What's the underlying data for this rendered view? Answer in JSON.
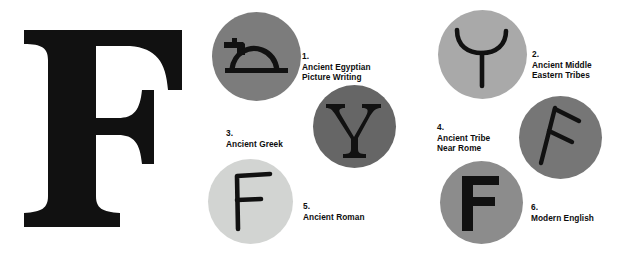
{
  "figure": {
    "hero_letter": "F",
    "background_color": "#ffffff",
    "glyph_color": "#111111"
  },
  "stages": [
    {
      "number": "1.",
      "label": "Ancient Egyptian\nPicture Writing",
      "glyph_name": "egyptian-horned-viper-hieroglyph",
      "glyph_text": "",
      "circle_color": "#7c7c7c"
    },
    {
      "number": "2.",
      "label": "Ancient Middle\nEastern Tribes",
      "glyph_name": "proto-sinaitic-waw-y",
      "glyph_text": "Y",
      "circle_color": "#a9a9a9"
    },
    {
      "number": "3.",
      "label": "Ancient Greek",
      "glyph_name": "greek-upsilon-serif-y",
      "glyph_text": "Y",
      "circle_color": "#666666"
    },
    {
      "number": "4.",
      "label": "Ancient Tribe\nNear Rome",
      "glyph_name": "etruscan-digamma-f",
      "glyph_text": "F",
      "circle_color": "#767676"
    },
    {
      "number": "5.",
      "label": "Ancient Roman",
      "glyph_name": "roman-capital-f",
      "glyph_text": "F",
      "circle_color": "#d2d4d2"
    },
    {
      "number": "6.",
      "label": "Modern English",
      "glyph_name": "modern-english-f",
      "glyph_text": "F",
      "circle_color": "#8c8c8c"
    }
  ]
}
